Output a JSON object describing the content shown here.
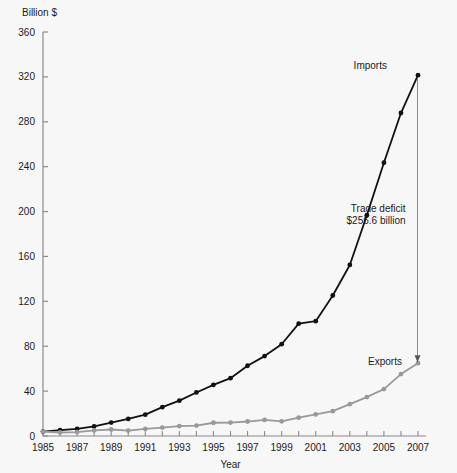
{
  "chart_data": {
    "type": "line",
    "title": "",
    "xlabel": "Year",
    "ylabel": "Billion $",
    "ylim": [
      0,
      360
    ],
    "xlim": [
      1985,
      2007
    ],
    "ytick_step": 40,
    "xtick_step": 1,
    "xtick_label_step": 2,
    "grid": false,
    "legend": "inline-labels",
    "x": [
      1985,
      1986,
      1987,
      1988,
      1989,
      1990,
      1991,
      1992,
      1993,
      1994,
      1995,
      1996,
      1997,
      1998,
      1999,
      2000,
      2001,
      2002,
      2003,
      2004,
      2005,
      2006,
      2007
    ],
    "series": [
      {
        "name": "Imports",
        "color": "#111111",
        "values": [
          3.9,
          5.2,
          6.3,
          8.5,
          12.0,
          15.2,
          19.0,
          25.7,
          31.5,
          38.8,
          45.6,
          51.5,
          62.6,
          71.2,
          81.8,
          100.1,
          102.3,
          125.2,
          152.4,
          196.7,
          243.5,
          287.8,
          321.5
        ]
      },
      {
        "name": "Exports",
        "color": "#999999",
        "values": [
          3.9,
          3.1,
          3.5,
          5.0,
          5.8,
          4.8,
          6.3,
          7.5,
          8.8,
          9.3,
          11.8,
          12.0,
          12.9,
          14.3,
          13.1,
          16.3,
          19.2,
          22.1,
          28.4,
          34.7,
          41.8,
          55.2,
          64.9
        ]
      }
    ],
    "annotations": [
      {
        "name": "imports-label",
        "text": "Imports"
      },
      {
        "name": "exports-label",
        "text": "Exports"
      },
      {
        "name": "deficit-line1",
        "text": "Trade deficit"
      },
      {
        "name": "deficit-line2",
        "text": "$256.6 billion"
      }
    ],
    "ytick_labels": [
      "0",
      "40",
      "80",
      "120",
      "160",
      "200",
      "240",
      "280",
      "320",
      "360"
    ],
    "xtick_labels": [
      "1985",
      "1987",
      "1989",
      "1991",
      "1993",
      "1995",
      "1997",
      "1999",
      "2001",
      "2003",
      "2005",
      "2007"
    ]
  }
}
